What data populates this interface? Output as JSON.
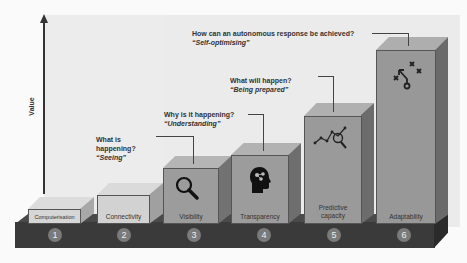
{
  "axis": {
    "ylabel": "Value"
  },
  "stages": [
    {
      "num": "1",
      "label": "Computerisation",
      "color": "#cfcfcf"
    },
    {
      "num": "2",
      "label": "Connectivity",
      "color": "#c8c8c8"
    },
    {
      "num": "3",
      "label": "Visibility",
      "color": "#9c9c9c",
      "icon": "magnifier-icon"
    },
    {
      "num": "4",
      "label": "Transparency",
      "color": "#9c9c9c",
      "icon": "head-brain-icon"
    },
    {
      "num": "5",
      "label_line1": "Predictive",
      "label_line2": "capacity",
      "color": "#9a9a9a",
      "icon": "graph-magnifier-icon"
    },
    {
      "num": "6",
      "label": "Adaptability",
      "color": "#989898",
      "icon": "strategy-play-icon"
    }
  ],
  "questions": [
    {
      "line1": "What is",
      "line2": "happening?",
      "quote": "“Seeing”"
    },
    {
      "line1": "Why is it happening?",
      "quote": "“Understanding”"
    },
    {
      "line1": "What will happen?",
      "quote": "“Being prepared”"
    },
    {
      "line1": "How can an autonomous response be achieved?",
      "quote": "“Self-optimising”"
    }
  ]
}
